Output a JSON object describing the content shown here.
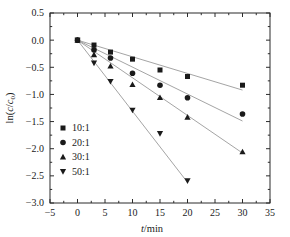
{
  "chart_data": {
    "type": "scatter",
    "title": "",
    "xlabel": "t/min",
    "ylabel": "ln(c/c0)",
    "ylabel_parts": {
      "prefix": "ln(",
      "italic_c": "c",
      "slash": "/",
      "italic_c2": "c",
      "sub": "0",
      "suffix": ")"
    },
    "xlabel_parts": {
      "italic_t": "t",
      "rest": "/min"
    },
    "xlim": [
      -5,
      35
    ],
    "ylim": [
      -3.0,
      0.5
    ],
    "xticks": [
      -5,
      0,
      5,
      10,
      15,
      20,
      25,
      30,
      35
    ],
    "xtick_labels": [
      "-5",
      "0",
      "5",
      "10",
      "15",
      "20",
      "25",
      "30",
      "35"
    ],
    "yticks": [
      0.5,
      0.0,
      -0.5,
      -1.0,
      -1.5,
      -2.0,
      -2.5,
      -3.0
    ],
    "ytick_labels": [
      "0.5",
      "0.0",
      "-0.5",
      "-1.0",
      "-1.5",
      "-2.0",
      "-2.5",
      "-3.0"
    ],
    "minor_ticks": true,
    "grid": false,
    "legend_position": "lower-left",
    "marker_color": "#1a1a1a",
    "line_color": "#9a9a9a",
    "axis_color": "#2b2b2b",
    "series": [
      {
        "name": "10:1",
        "marker": "square",
        "x": [
          0,
          3,
          6,
          10,
          15,
          20,
          30
        ],
        "y": [
          0.0,
          -0.09,
          -0.22,
          -0.35,
          -0.55,
          -0.67,
          -0.83
        ],
        "fit": {
          "x0": 0,
          "y0": 0.0,
          "x1": 30,
          "y1": -0.92
        }
      },
      {
        "name": "20:1",
        "marker": "circle",
        "x": [
          0,
          3,
          6,
          10,
          15,
          20,
          30
        ],
        "y": [
          0.0,
          -0.18,
          -0.33,
          -0.61,
          -0.83,
          -1.06,
          -1.36
        ],
        "fit": {
          "x0": 0,
          "y0": 0.0,
          "x1": 30,
          "y1": -1.49
        }
      },
      {
        "name": "30:1",
        "marker": "triangle-up",
        "x": [
          0,
          3,
          6,
          10,
          15,
          20,
          30
        ],
        "y": [
          0.0,
          -0.27,
          -0.48,
          -0.82,
          -1.06,
          -1.42,
          -2.06
        ],
        "fit": {
          "x0": 0,
          "y0": 0.0,
          "x1": 30,
          "y1": -2.08
        }
      },
      {
        "name": "50:1",
        "marker": "triangle-down",
        "x": [
          0,
          3,
          6,
          10,
          15,
          20
        ],
        "y": [
          0.0,
          -0.42,
          -0.76,
          -1.29,
          -1.72,
          -2.59
        ],
        "fit": {
          "x0": 0,
          "y0": 0.0,
          "x1": 20,
          "y1": -2.62
        }
      }
    ],
    "legend_entries": [
      {
        "label": "10:1",
        "marker": "square"
      },
      {
        "label": "20:1",
        "marker": "circle"
      },
      {
        "label": "30:1",
        "marker": "triangle-up"
      },
      {
        "label": "50:1",
        "marker": "triangle-down"
      }
    ]
  }
}
